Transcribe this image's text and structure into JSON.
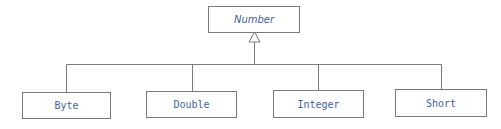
{
  "diagram": {
    "type": "uml-class-inheritance",
    "parent": {
      "label": "Number",
      "style": "italic (abstract)"
    },
    "children": [
      {
        "label": "Byte"
      },
      {
        "label": "Double"
      },
      {
        "label": "Integer"
      },
      {
        "label": "Short"
      }
    ],
    "relationship": "generalization (hollow triangle arrow to parent)",
    "colors": {
      "text": "#3f62a0",
      "lines": "#7a7a7a",
      "background": "#ffffff"
    }
  }
}
